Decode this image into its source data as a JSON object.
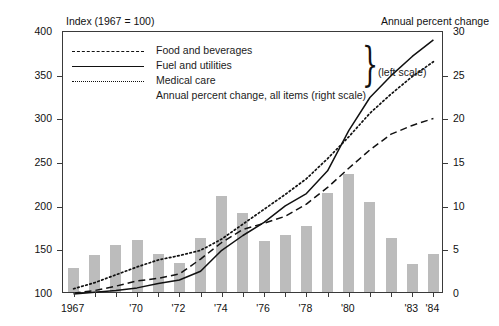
{
  "chart_data": {
    "type": "bar",
    "title": "",
    "left_axis_title": "Index (1967 = 100)",
    "right_axis_title": "Annual percent change",
    "xlabel": "",
    "ylabel": "Index (1967 = 100)",
    "ylabel_right": "Annual percent change",
    "ylim": [
      100,
      400
    ],
    "ylim_right": [
      0,
      30
    ],
    "yticks": [
      100,
      150,
      200,
      250,
      300,
      350,
      400
    ],
    "yticks_right": [
      0,
      5,
      10,
      15,
      20,
      25,
      30
    ],
    "grid": false,
    "legend_position": "top-left",
    "x": [
      1967,
      1968,
      1969,
      1970,
      1971,
      1972,
      1973,
      1974,
      1975,
      1976,
      1977,
      1978,
      1979,
      1980,
      1981,
      1982,
      1983,
      1984
    ],
    "xtick_labels": [
      "1967",
      "",
      "",
      "'70",
      "",
      "'72",
      "",
      "'74",
      "",
      "'76",
      "",
      "'78",
      "",
      "'80",
      "",
      "",
      "'83",
      "'84"
    ],
    "categories": [
      "1967",
      "1968",
      "1969",
      "1970",
      "1971",
      "1972",
      "1973",
      "1974",
      "1975",
      "1976",
      "1977",
      "1978",
      "1979",
      "1980",
      "1981",
      "1982",
      "1983",
      "1984"
    ],
    "bars": {
      "name": "Annual percent change, all items (right scale)",
      "unit": "percent",
      "axis": "right",
      "color": "#bcbcbc",
      "values": [
        2.8,
        4.2,
        5.4,
        5.9,
        4.3,
        3.3,
        6.2,
        11.0,
        9.1,
        5.8,
        6.5,
        7.6,
        11.3,
        13.5,
        10.3,
        6.2,
        3.2,
        4.3
      ]
    },
    "series": [
      {
        "name": "Food and beverages",
        "axis": "left",
        "style": "dashed",
        "color": "#111111",
        "values": [
          101,
          104,
          109,
          115,
          118,
          123,
          140,
          159,
          174,
          181,
          189,
          203,
          222,
          244,
          265,
          283,
          293,
          301
        ]
      },
      {
        "name": "Fuel and utilities",
        "axis": "left",
        "style": "solid",
        "color": "#111111",
        "values": [
          100,
          102,
          104,
          107,
          112,
          116,
          126,
          150,
          167,
          182,
          201,
          215,
          241,
          287,
          325,
          350,
          372,
          391
        ]
      },
      {
        "name": "Medical care",
        "axis": "left",
        "style": "dotted",
        "color": "#111111",
        "values": [
          106,
          113,
          122,
          131,
          139,
          144,
          150,
          163,
          180,
          197,
          214,
          232,
          255,
          280,
          307,
          329,
          349,
          366
        ]
      }
    ],
    "annotations": {
      "brace_label": "(left scale)",
      "right_scale_note": "Annual percent change, all items (right scale)"
    }
  },
  "legend": {
    "items": [
      {
        "label": "Food and beverages",
        "key": "dashed-line-key"
      },
      {
        "label": "Fuel and utilities",
        "key": "solid-line-key"
      },
      {
        "label": "Medical care",
        "key": "dotted-line-key"
      }
    ],
    "wide_item": "Annual percent change, all items (right scale)",
    "brace_label": "(left scale)",
    "brace_glyph": "}"
  }
}
